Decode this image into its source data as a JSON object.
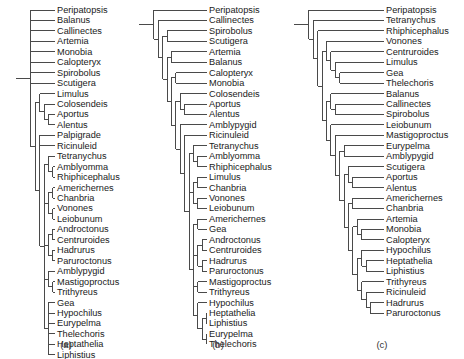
{
  "figure": {
    "type": "phylogenetic-cladogram-set",
    "panel_count": 3,
    "background_color": "#ffffff",
    "line_color": "#4a4a4a",
    "text_color": "#1a1a1a"
  },
  "panels": [
    {
      "caption": "(a)",
      "caption_x": 66,
      "caption_y": 348,
      "origin_x": 22,
      "origin_y": 10,
      "row_height": 10.45,
      "label_x": 57,
      "taxa": [
        "Peripatopsis",
        "Balanus",
        "Callinectes",
        "Artemia",
        "Monobia",
        "Calopteryx",
        "Spirobolus",
        "Scutigera",
        "Limulus",
        "Colosendeis",
        "Aportus",
        "Alentus",
        "Palpigrade",
        "Ricinuleid",
        "Tetranychus",
        "Amblyomma",
        "Rhiphicephalus",
        "Americhernes",
        "Chanbria",
        "Vonones",
        "Leiobunum",
        "Androctonus",
        "Centruroides",
        "Hadrurus",
        "Paruroctonus",
        "Amblypygid",
        "Mastigoproctus",
        "Trithyreus",
        "Gea",
        "Hypochilus",
        "Eurypelma",
        "Thelechoris",
        "Heptathelia",
        "Liphistius"
      ],
      "tip_x": [
        55,
        55,
        55,
        55,
        55,
        55,
        55,
        55,
        52,
        52,
        52,
        52,
        50,
        50,
        52,
        52,
        52,
        52,
        52,
        52,
        52,
        54,
        54,
        54,
        54,
        50,
        52,
        52,
        52,
        52,
        52,
        52,
        52,
        52
      ]
    },
    {
      "caption": "(b)",
      "caption_x": 218,
      "caption_y": 348,
      "origin_x": 145,
      "origin_y": 10,
      "row_height": 10.45,
      "label_x": 209,
      "taxa": [
        "Peripatopsis",
        "Callinectes",
        "Spirobolus",
        "Scutigera",
        "Artemia",
        "Balanus",
        "Calopteryx",
        "Monobia",
        "Colosendeis",
        "Aportus",
        "Alentus",
        "Amblypygid",
        "Ricinuleid",
        "Tetranychus",
        "Amblyomma",
        "Rhiphicephalus",
        "Limulus",
        "Chanbria",
        "Vonones",
        "Leiobunum",
        "Americhernes",
        "Gea",
        "Androctonus",
        "Centruroides",
        "Hadrurus",
        "Paruroctonus",
        "Mastigoproctus",
        "Trithyreus",
        "Hypochilus",
        "Heptathelia",
        "Liphistius",
        "Eurypelma",
        "Thelechoris"
      ]
    },
    {
      "caption": "(c)",
      "caption_x": 382,
      "caption_y": 348,
      "origin_x": 300,
      "origin_y": 10,
      "row_height": 10.45,
      "label_x": 386,
      "taxa": [
        "Peripatopsis",
        "Tetranychus",
        "Rhiphicephalus",
        "Vonones",
        "Centruroides",
        "Limulus",
        "Gea",
        "Thelechoris",
        "Balanus",
        "Callinectes",
        "Spirobolus",
        "Leiobunum",
        "Mastigoproctus",
        "Eurypelma",
        "Amblypygid",
        "Scutigera",
        "Aportus",
        "Alentus",
        "Americhernes",
        "Chanbria",
        "Artemia",
        "Monobia",
        "Calopteryx",
        "Hypochilus",
        "Heptathelia",
        "Liphistius",
        "Trithyreus",
        "Ricinuleid",
        "Hadrurus",
        "Paruroctonus"
      ]
    }
  ],
  "chart_data": {
    "type": "table",
    "title": "",
    "panel_labels": [
      "(a)",
      "(b)",
      "(c)"
    ],
    "taxa_counts": [
      34,
      33,
      30
    ]
  }
}
